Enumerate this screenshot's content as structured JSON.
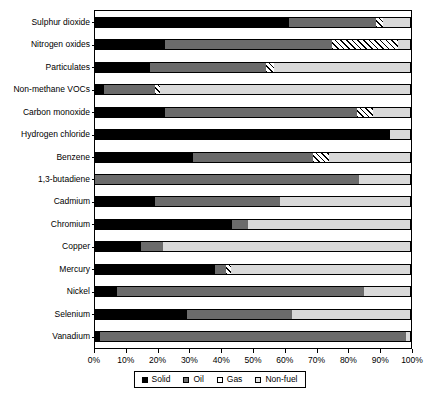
{
  "chart_data": {
    "type": "bar",
    "orientation": "horizontal",
    "stacked": true,
    "title": "",
    "xlabel": "",
    "ylabel": "",
    "xlim": [
      0,
      100
    ],
    "xticks": [
      0,
      10,
      20,
      30,
      40,
      50,
      60,
      70,
      80,
      90,
      100
    ],
    "xtick_labels": [
      "0%",
      "10%",
      "20%",
      "30%",
      "40%",
      "50%",
      "60%",
      "70%",
      "80%",
      "90%",
      "100%"
    ],
    "grid": false,
    "legend_position": "bottom",
    "categories": [
      "Sulphur dioxide",
      "Nitrogen oxides",
      "Particulates",
      "Non-methane VOCs",
      "Carbon monoxide",
      "Hydrogen chloride",
      "Benzene",
      "1,3-butadiene",
      "Cadmium",
      "Chromium",
      "Copper",
      "Mercury",
      "Nickel",
      "Selenium",
      "Vanadium"
    ],
    "series": [
      {
        "name": "Solid",
        "color": "#000000",
        "values": [
          61.5,
          22.0,
          17.5,
          3.0,
          22.0,
          93.5,
          31.0,
          0.0,
          19.0,
          43.5,
          14.5,
          38.0,
          7.0,
          29.0,
          1.5
        ]
      },
      {
        "name": "Oil",
        "color": "#6b6b6b",
        "values": [
          27.5,
          53.0,
          36.5,
          16.0,
          61.0,
          0.0,
          38.0,
          83.5,
          39.5,
          5.0,
          7.0,
          3.5,
          78.0,
          33.5,
          97.0
        ]
      },
      {
        "name": "Gas",
        "color": "#ffffff",
        "values": [
          2.0,
          21.0,
          2.5,
          1.5,
          5.0,
          0.0,
          5.0,
          0.0,
          0.0,
          0.0,
          0.0,
          1.5,
          0.0,
          0.0,
          0.0
        ]
      },
      {
        "name": "Non-fuel",
        "color": "#d9d9d9",
        "values": [
          9.0,
          4.0,
          43.5,
          79.5,
          12.0,
          6.5,
          26.0,
          16.5,
          41.5,
          51.5,
          78.5,
          57.0,
          15.0,
          37.5,
          1.5
        ]
      }
    ]
  },
  "legend": {
    "items": [
      {
        "label": "Solid",
        "key": "solid"
      },
      {
        "label": "Oil",
        "key": "oil"
      },
      {
        "label": "Gas",
        "key": "gas"
      },
      {
        "label": "Non-fuel",
        "key": "nonfuel"
      }
    ]
  }
}
